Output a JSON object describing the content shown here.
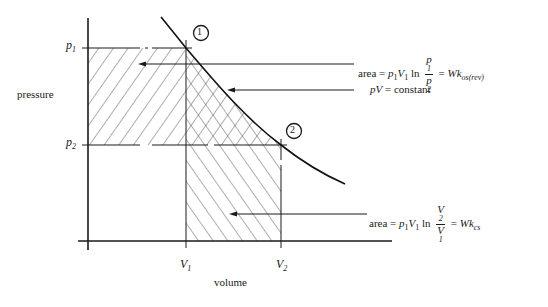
{
  "diagram": {
    "type": "pV isothermal expansion diagram",
    "axes": {
      "y_label": "pressure",
      "x_label": "volume",
      "y_ticks": [
        {
          "label": "p",
          "sub": "1"
        },
        {
          "label": "p",
          "sub": "2"
        }
      ],
      "x_ticks": [
        {
          "label": "V",
          "sub": "1"
        },
        {
          "label": "V",
          "sub": "2"
        }
      ]
    },
    "points": [
      {
        "id": "1",
        "label": "1"
      },
      {
        "id": "2",
        "label": "2"
      }
    ],
    "annotations": {
      "top_area": {
        "prefix": "area  =",
        "term1": "p",
        "term1_sub": "1",
        "term2": "V",
        "term2_sub": "1",
        "ln": "ln",
        "frac_num": "p",
        "frac_num_sub": "1",
        "frac_den": "p",
        "frac_den_sub": "2",
        "equals": "=",
        "result": "Wk",
        "result_sub": "os(rev)"
      },
      "curve": {
        "text_italic": "pV",
        "text_rest": " = constant"
      },
      "bottom_area": {
        "prefix": "area  =",
        "term1": "p",
        "term1_sub": "1",
        "term2": "V",
        "term2_sub": "1",
        "ln": "ln",
        "frac_num": "V",
        "frac_num_sub": "2",
        "frac_den": "V",
        "frac_den_sub": "1",
        "equals": "=",
        "result": "Wk",
        "result_sub": "cs"
      }
    },
    "colors": {
      "ink": "#1a1a1a",
      "background": "#ffffff"
    }
  }
}
